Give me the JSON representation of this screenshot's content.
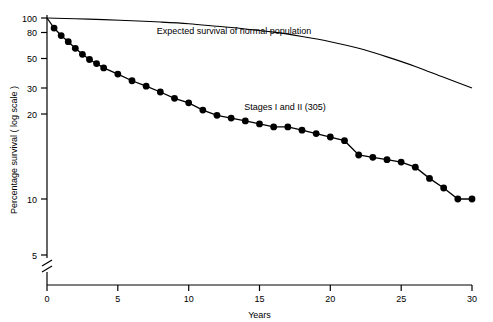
{
  "chart_data": {
    "type": "line",
    "title": "",
    "xlabel": "Years",
    "ylabel": "Percentage survival ( log scale )",
    "xlim": [
      0,
      30
    ],
    "ylim_log": [
      4,
      100
    ],
    "grid": false,
    "legend_position": "none",
    "x_ticks": [
      0,
      5,
      10,
      15,
      20,
      25,
      30
    ],
    "x_tick_labels": [
      "0",
      "5",
      "10",
      "15",
      "20",
      "25",
      "30"
    ],
    "y_ticks": [
      5,
      10,
      20,
      30,
      50,
      80,
      100
    ],
    "y_tick_labels": [
      "5",
      "10",
      "20",
      "30",
      "50",
      "80",
      "100"
    ],
    "axis_break": true,
    "series": [
      {
        "name": "Stages I and II (305)",
        "style": "line-with-filled-circle-markers",
        "annotation": "Stages I and II (305)",
        "x": [
          0,
          0.5,
          1,
          1.5,
          2,
          2.5,
          3,
          3.5,
          4,
          5,
          6,
          7,
          8,
          9,
          10,
          11,
          12,
          13,
          14,
          15,
          16,
          17,
          18,
          19,
          20,
          21,
          22,
          23,
          24,
          25,
          26,
          27,
          28,
          29,
          30
        ],
        "y": [
          100,
          88,
          80,
          74,
          68,
          63,
          59,
          56,
          53,
          49,
          45,
          42,
          39,
          36,
          34,
          31,
          29,
          28,
          27,
          26,
          25,
          25,
          24,
          23,
          22,
          21,
          17.5,
          17,
          16.5,
          16,
          15,
          13,
          11.5,
          10,
          10
        ]
      },
      {
        "name": "Expected survival of normal population",
        "style": "smooth-line-no-markers",
        "annotation": "Expected survival of normal population",
        "x": [
          0,
          2,
          4,
          6,
          8,
          10,
          12,
          14,
          16,
          18,
          20,
          22,
          24,
          26,
          28,
          30
        ],
        "y": [
          100,
          99,
          98,
          96.5,
          95,
          93,
          90,
          87,
          83.5,
          79,
          74,
          68,
          61,
          54,
          47,
          41
        ]
      }
    ],
    "annotations": [
      {
        "text": "Expected survival of normal population",
        "x": 13.2,
        "y": 82
      },
      {
        "text": "Stages I and II (305)",
        "x": 16.8,
        "y": 31
      }
    ]
  }
}
